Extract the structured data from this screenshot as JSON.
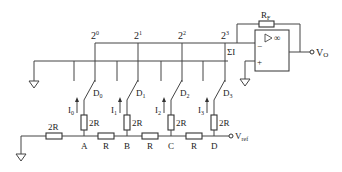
{
  "diagram": {
    "bit_weights": [
      "2",
      "2",
      "2",
      "2"
    ],
    "bit_exponents": [
      "0",
      "1",
      "2",
      "3"
    ],
    "sum_label": "ΣI",
    "feedback_resistor": {
      "label": "R",
      "sub": "F"
    },
    "opamp": {
      "symbol": "▷∞",
      "minus": "−",
      "plus": "+"
    },
    "output": {
      "label": "V",
      "sub": "O"
    },
    "reference": {
      "label": "V",
      "sub": "ref"
    },
    "switches": [
      {
        "label": "D",
        "sub": "0"
      },
      {
        "label": "D",
        "sub": "1"
      },
      {
        "label": "D",
        "sub": "2"
      },
      {
        "label": "D",
        "sub": "3"
      }
    ],
    "currents": [
      {
        "label": "I",
        "sub": "0"
      },
      {
        "label": "I",
        "sub": "1"
      },
      {
        "label": "I",
        "sub": "2"
      },
      {
        "label": "I",
        "sub": "3"
      }
    ],
    "branch_resistors": [
      "2R",
      "2R",
      "2R",
      "2R"
    ],
    "termination_resistor": "2R",
    "series_resistors": [
      "R",
      "R",
      "R"
    ],
    "nodes": [
      "A",
      "B",
      "C",
      "D"
    ]
  }
}
